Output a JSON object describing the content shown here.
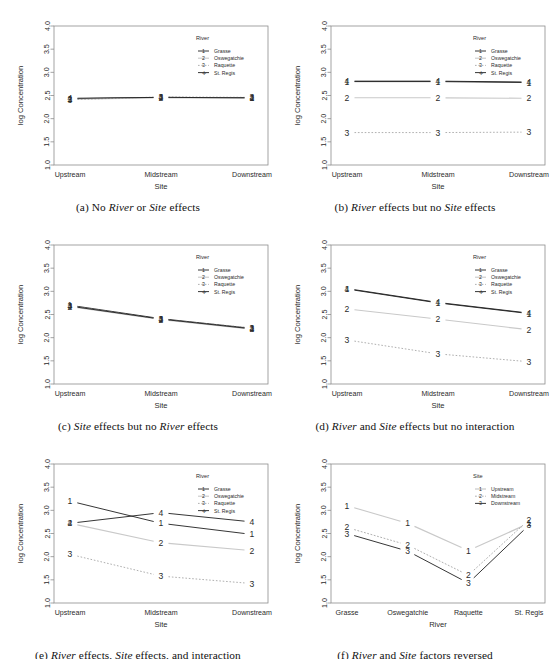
{
  "figure": {
    "axis": {
      "ylabel": "log Concentration",
      "yticks": [
        "1.0",
        "1.5",
        "2.0",
        "2.5",
        "3.0",
        "3.5",
        "4.0"
      ],
      "ylim": [
        1.0,
        4.0
      ],
      "site_xlabel": "Site",
      "site_categories": [
        "Upstream",
        "Midstream",
        "Downstream"
      ],
      "river_xlabel": "River",
      "river_categories": [
        "Grasse",
        "Oswegatchie",
        "Raquette",
        "St. Regis"
      ]
    },
    "river_legend": {
      "title": "River",
      "items": [
        {
          "key": "1",
          "label": "Grasse"
        },
        {
          "key": "2",
          "label": "Oswegatchie"
        },
        {
          "key": "3",
          "label": "Raquette"
        },
        {
          "key": "+",
          "label": "St. Regis"
        }
      ]
    },
    "site_legend": {
      "title": "Site",
      "items": [
        {
          "key": "1",
          "label": "Upstream"
        },
        {
          "key": "2",
          "label": "Midstream"
        },
        {
          "key": "3",
          "label": "Downstream"
        }
      ]
    },
    "colors": {
      "dark": "#1f1f1f",
      "mid": "#9a9a9a",
      "light": "#c9c9c9",
      "box": "#8d8d8d"
    }
  },
  "chart_data": [
    {
      "id": "a",
      "type": "line",
      "title": "No River or Site effects",
      "caption_parts": [
        "(a) No ",
        "River",
        " or ",
        "Site",
        " effects"
      ],
      "xlabel": "Site",
      "ylabel": "log Concentration",
      "categories": [
        "Upstream",
        "Midstream",
        "Downstream"
      ],
      "ylim": [
        1.0,
        4.0
      ],
      "grid": false,
      "legend": "River",
      "legend_position": "top-right-inside",
      "series": [
        {
          "name": "Grasse",
          "marker": "1",
          "values": [
            2.43,
            2.46,
            2.45
          ]
        },
        {
          "name": "Oswegatchie",
          "marker": "2",
          "values": [
            2.42,
            2.45,
            2.44
          ]
        },
        {
          "name": "Raquette",
          "marker": "3",
          "values": [
            2.41,
            2.47,
            2.46
          ]
        },
        {
          "name": "St. Regis",
          "marker": "+",
          "values": [
            2.44,
            2.46,
            2.45
          ]
        }
      ]
    },
    {
      "id": "b",
      "type": "line",
      "title": "River effects but no Site effects",
      "caption_parts": [
        "(b) ",
        "River",
        " effects but no ",
        "Site",
        " effects"
      ],
      "xlabel": "Site",
      "ylabel": "log Concentration",
      "categories": [
        "Upstream",
        "Midstream",
        "Downstream"
      ],
      "ylim": [
        1.0,
        4.0
      ],
      "grid": false,
      "legend": "River",
      "legend_position": "top-right-inside",
      "series": [
        {
          "name": "Grasse",
          "marker": "1",
          "values": [
            2.8,
            2.8,
            2.78
          ]
        },
        {
          "name": "Oswegatchie",
          "marker": "2",
          "values": [
            2.45,
            2.45,
            2.44
          ]
        },
        {
          "name": "Raquette",
          "marker": "3",
          "values": [
            1.7,
            1.7,
            1.71
          ]
        },
        {
          "name": "St. Regis",
          "marker": "+",
          "values": [
            2.81,
            2.81,
            2.79
          ]
        }
      ]
    },
    {
      "id": "c",
      "type": "line",
      "title": "Site effects but no River effects",
      "caption_parts": [
        "(c) ",
        "Site",
        " effects but no ",
        "River",
        " effects"
      ],
      "xlabel": "Site",
      "ylabel": "log Concentration",
      "categories": [
        "Upstream",
        "Midstream",
        "Downstream"
      ],
      "ylim": [
        1.0,
        4.0
      ],
      "grid": false,
      "legend": "River",
      "legend_position": "top-right-inside",
      "series": [
        {
          "name": "Grasse",
          "marker": "1",
          "values": [
            2.7,
            2.41,
            2.2
          ]
        },
        {
          "name": "Oswegatchie",
          "marker": "2",
          "values": [
            2.67,
            2.39,
            2.18
          ]
        },
        {
          "name": "Raquette",
          "marker": "3",
          "values": [
            2.69,
            2.4,
            2.21
          ]
        },
        {
          "name": "St. Regis",
          "marker": "+",
          "values": [
            2.68,
            2.4,
            2.19
          ]
        }
      ]
    },
    {
      "id": "d",
      "type": "line",
      "title": "River and Site effects but no interaction",
      "caption_parts": [
        "(d) ",
        "River",
        " and ",
        "Site",
        " effects but no interaction"
      ],
      "xlabel": "Site",
      "ylabel": "log Concentration",
      "categories": [
        "Upstream",
        "Midstream",
        "Downstream"
      ],
      "ylim": [
        1.0,
        4.0
      ],
      "grid": false,
      "legend": "River",
      "legend_position": "top-right-inside",
      "series": [
        {
          "name": "Grasse",
          "marker": "1",
          "values": [
            3.05,
            2.75,
            2.52
          ]
        },
        {
          "name": "Oswegatchie",
          "marker": "2",
          "values": [
            2.62,
            2.4,
            2.17
          ]
        },
        {
          "name": "Raquette",
          "marker": "3",
          "values": [
            1.95,
            1.65,
            1.48
          ]
        },
        {
          "name": "St. Regis",
          "marker": "+",
          "values": [
            3.06,
            2.76,
            2.53
          ]
        }
      ]
    },
    {
      "id": "e",
      "type": "line",
      "title": "River effects, Site effects, and interaction",
      "caption_parts": [
        "(e) ",
        "River",
        " effects, ",
        "Site",
        " effects, and interaction"
      ],
      "xlabel": "Site",
      "ylabel": "log Concentration",
      "categories": [
        "Upstream",
        "Midstream",
        "Downstream"
      ],
      "ylim": [
        1.0,
        4.0
      ],
      "grid": false,
      "legend": "River",
      "legend_position": "top-right-inside",
      "series": [
        {
          "name": "Grasse",
          "marker": "1",
          "values": [
            3.2,
            2.72,
            2.48
          ]
        },
        {
          "name": "Oswegatchie",
          "marker": "2",
          "values": [
            2.72,
            2.3,
            2.13
          ]
        },
        {
          "name": "Raquette",
          "marker": "3",
          "values": [
            2.05,
            1.58,
            1.42
          ]
        },
        {
          "name": "St. Regis",
          "marker": "+",
          "values": [
            2.72,
            2.95,
            2.75
          ]
        }
      ]
    },
    {
      "id": "f",
      "type": "line",
      "title": "River and Site factors reversed",
      "caption_parts": [
        "(f) ",
        "River",
        " and ",
        "Site",
        " factors reversed"
      ],
      "xlabel": "River",
      "ylabel": "log Concentration",
      "categories": [
        "Grasse",
        "Oswegatchie",
        "Raquette",
        "St. Regis"
      ],
      "ylim": [
        1.0,
        4.0
      ],
      "grid": false,
      "legend": "Site",
      "legend_position": "top-right-inside",
      "series": [
        {
          "name": "Upstream",
          "marker": "1",
          "values": [
            3.1,
            2.72,
            2.13,
            2.72
          ]
        },
        {
          "name": "Midstream",
          "marker": "2",
          "values": [
            2.63,
            2.25,
            1.6,
            2.8
          ]
        },
        {
          "name": "Downstream",
          "marker": "3",
          "values": [
            2.5,
            2.12,
            1.43,
            2.68
          ]
        }
      ]
    }
  ]
}
